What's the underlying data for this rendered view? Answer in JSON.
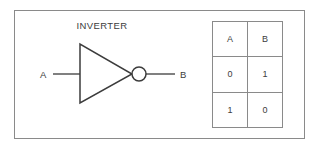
{
  "figure": {
    "title": "INVERTER",
    "border_color": "#8a8a8a",
    "ink_color": "#3c3c3c",
    "background": "#ffffff"
  },
  "gate": {
    "symbol": "inverter-triangle-with-bubble",
    "input": {
      "label": "A",
      "name": "input-pin-a"
    },
    "output": {
      "label": "B",
      "name": "output-pin-b"
    }
  },
  "truth_table": {
    "headers": [
      "A",
      "B"
    ],
    "rows": [
      [
        "0",
        "1"
      ],
      [
        "1",
        "0"
      ]
    ]
  }
}
